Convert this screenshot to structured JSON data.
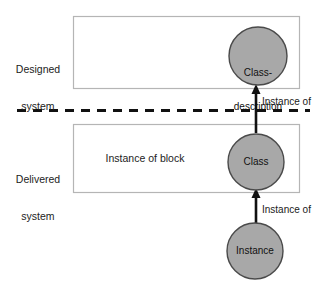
{
  "diagram": {
    "colors": {
      "node_fill": "#a8a8a8",
      "node_stroke": "#4a4a4a",
      "box_stroke": "#b5b5b5",
      "line": "#111111",
      "text": "#1a1a1a",
      "background": "#ffffff"
    },
    "side_labels": [
      {
        "name": "designed-system",
        "line1": "Designed",
        "line2": "system"
      },
      {
        "name": "delivered-system",
        "line1": "Delivered",
        "line2": "system"
      }
    ],
    "boxes": [
      {
        "name": "designed-system-box",
        "label": ""
      },
      {
        "name": "delivered-system-box",
        "label": "Instance of block"
      }
    ],
    "separator": {
      "name": "system-boundary",
      "style": "dashed"
    },
    "nodes": [
      {
        "name": "class-description-node",
        "line1": "Class-",
        "line2": "description"
      },
      {
        "name": "class-node",
        "line1": "Class",
        "line2": ""
      },
      {
        "name": "instance-node",
        "line1": "Instance",
        "line2": ""
      }
    ],
    "edges": [
      {
        "name": "instance-of-edge-upper",
        "label": "Instance of"
      },
      {
        "name": "instance-of-edge-lower",
        "label": "Instance of"
      }
    ]
  }
}
